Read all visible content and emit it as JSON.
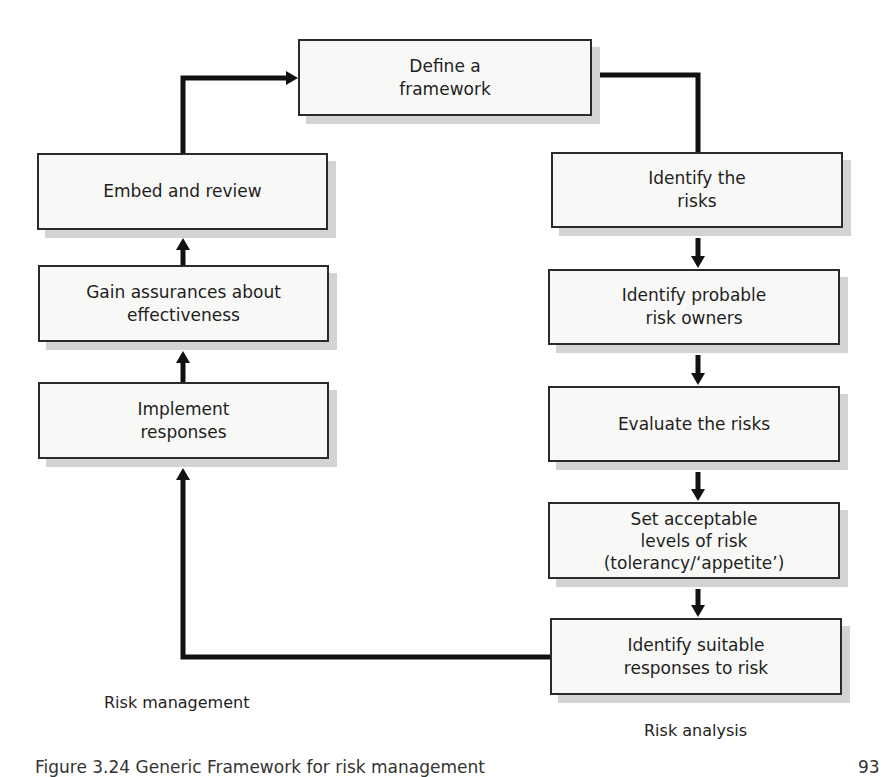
{
  "figure": {
    "nodes": [
      {
        "id": "define",
        "text": "Define a\nframework"
      },
      {
        "id": "identify-risks",
        "text": "Identify the\nrisks"
      },
      {
        "id": "identify-owners",
        "text": "Identify probable\nrisk owners"
      },
      {
        "id": "evaluate",
        "text": "Evaluate the risks"
      },
      {
        "id": "set-levels",
        "text": "Set acceptable\nlevels of risk\n(tolerancy/‘appetite’)"
      },
      {
        "id": "identify-responses",
        "text": "Identify suitable\nresponses to risk"
      },
      {
        "id": "implement",
        "text": "Implement\nresponses"
      },
      {
        "id": "gain-assurances",
        "text": "Gain assurances about\neffectiveness"
      },
      {
        "id": "embed",
        "text": "Embed and review"
      }
    ],
    "edges": [
      {
        "from": "define",
        "to": "identify-risks"
      },
      {
        "from": "identify-risks",
        "to": "identify-owners"
      },
      {
        "from": "identify-owners",
        "to": "evaluate"
      },
      {
        "from": "evaluate",
        "to": "set-levels"
      },
      {
        "from": "set-levels",
        "to": "identify-responses"
      },
      {
        "from": "identify-responses",
        "to": "implement"
      },
      {
        "from": "implement",
        "to": "gain-assurances"
      },
      {
        "from": "gain-assurances",
        "to": "embed"
      },
      {
        "from": "embed",
        "to": "define"
      }
    ],
    "section_labels": {
      "left": "Risk management",
      "right": "Risk analysis"
    },
    "caption": "Figure 3.24   Generic Framework for risk management",
    "page_number": "93"
  },
  "colors": {
    "line": "#111111",
    "box_fill": "#f8f8f7",
    "box_border": "#2a2a2a",
    "shadow": "#d3d3d3"
  }
}
